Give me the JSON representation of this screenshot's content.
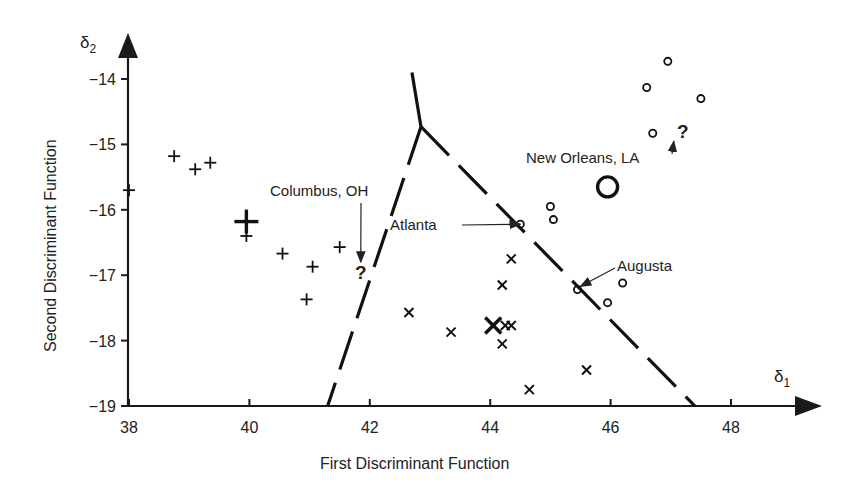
{
  "chart_data": {
    "type": "scatter",
    "title": "",
    "xlabel": "First Discriminant Function",
    "ylabel": "Second Discriminant Function",
    "x_axis_symbol": "δ",
    "x_axis_subscript": "1",
    "y_axis_symbol": "δ",
    "y_axis_subscript": "2",
    "xlim": [
      38,
      49
    ],
    "ylim": [
      -19,
      -13.4
    ],
    "x_ticks": [
      38,
      40,
      42,
      44,
      46,
      48
    ],
    "y_ticks": [
      -14,
      -15,
      -16,
      -17,
      -18,
      -19
    ],
    "x_tick_labels": [
      "38",
      "40",
      "42",
      "44",
      "46",
      "48"
    ],
    "y_tick_labels": [
      "−14",
      "−15",
      "−16",
      "−17",
      "−18",
      "−19"
    ],
    "grid": false,
    "legend": null,
    "series": [
      {
        "name": "Group 1",
        "marker": "plus",
        "points": [
          {
            "x": 38.0,
            "y": -15.7
          },
          {
            "x": 38.75,
            "y": -15.18
          },
          {
            "x": 39.1,
            "y": -15.38
          },
          {
            "x": 39.35,
            "y": -15.28
          },
          {
            "x": 39.95,
            "y": -16.4
          },
          {
            "x": 40.55,
            "y": -16.67
          },
          {
            "x": 41.05,
            "y": -16.87
          },
          {
            "x": 40.95,
            "y": -17.37
          },
          {
            "x": 41.5,
            "y": -16.57
          }
        ],
        "centroid": {
          "x": 39.95,
          "y": -16.18
        }
      },
      {
        "name": "Group 2",
        "marker": "x",
        "points": [
          {
            "x": 42.65,
            "y": -17.57
          },
          {
            "x": 43.35,
            "y": -17.87
          },
          {
            "x": 44.35,
            "y": -16.75
          },
          {
            "x": 44.2,
            "y": -17.15
          },
          {
            "x": 44.25,
            "y": -17.77
          },
          {
            "x": 44.35,
            "y": -17.77
          },
          {
            "x": 44.2,
            "y": -18.05
          },
          {
            "x": 44.65,
            "y": -18.75
          },
          {
            "x": 45.6,
            "y": -18.45
          }
        ],
        "centroid": {
          "x": 44.05,
          "y": -17.77
        }
      },
      {
        "name": "Group 3",
        "marker": "circle",
        "points": [
          {
            "x": 44.5,
            "y": -16.22
          },
          {
            "x": 45.0,
            "y": -15.95
          },
          {
            "x": 45.05,
            "y": -16.15
          },
          {
            "x": 45.45,
            "y": -17.22
          },
          {
            "x": 45.95,
            "y": -17.42
          },
          {
            "x": 46.2,
            "y": -17.12
          },
          {
            "x": 46.6,
            "y": -14.13
          },
          {
            "x": 46.7,
            "y": -14.83
          },
          {
            "x": 46.95,
            "y": -13.73
          },
          {
            "x": 47.5,
            "y": -14.3
          }
        ],
        "centroid": {
          "x": 45.95,
          "y": -15.65
        }
      }
    ],
    "unknowns": [
      {
        "label": "Columbus, OH",
        "marker": "?",
        "x": 41.85,
        "y": -16.95
      },
      {
        "label": "New Orleans, LA",
        "marker": "?",
        "x": 47.2,
        "y": -14.8
      }
    ],
    "annotations": [
      {
        "text": "Columbus, OH",
        "points_to": {
          "x": 41.85,
          "y": -16.8
        }
      },
      {
        "text": "New Orleans, LA",
        "points_to": {
          "x": 47.05,
          "y": -14.95
        }
      },
      {
        "text": "Atlanta",
        "points_to": {
          "x": 44.5,
          "y": -16.22
        }
      },
      {
        "text": "Augusta",
        "points_to": {
          "x": 45.5,
          "y": -17.17
        }
      }
    ],
    "boundaries": [
      {
        "from": {
          "x": 42.85,
          "y": -14.73
        },
        "to": {
          "x": 42.7,
          "y": -13.9
        },
        "style": "solid"
      },
      {
        "from": {
          "x": 42.85,
          "y": -14.73
        },
        "to": {
          "x": 41.3,
          "y": -19.0
        },
        "style": "dashed"
      },
      {
        "from": {
          "x": 42.85,
          "y": -14.73
        },
        "to": {
          "x": 47.4,
          "y": -19.0
        },
        "style": "dashed"
      }
    ]
  }
}
